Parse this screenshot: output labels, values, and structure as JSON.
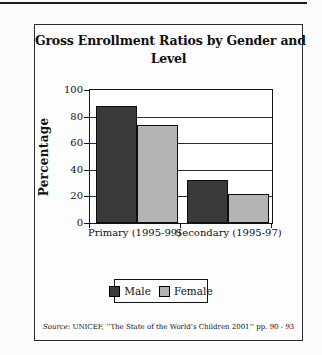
{
  "chart_data": {
    "type": "bar",
    "title": "Gross Enrollment Ratios by Gender and Level",
    "title_lines": [
      "Gross Enrollment Ratios by Gender and",
      "Level"
    ],
    "categories": [
      "Primary (1995-99)",
      "Secondary (1995-97)"
    ],
    "series": [
      {
        "name": "Male",
        "color": "#3a3a3a",
        "values": [
          88,
          32
        ]
      },
      {
        "name": "Female",
        "color": "#b4b4b4",
        "values": [
          74,
          22
        ]
      }
    ],
    "xlabel": "",
    "ylabel": "Percentage",
    "ylim": [
      0,
      100
    ],
    "yticks": [
      0,
      20,
      40,
      60,
      80,
      100
    ],
    "grid": true,
    "legend_position": "below-plot"
  },
  "source": {
    "prefix": "Source:",
    "text": " UNICEF, ‘‘The State of the World’s Children 2001’’ pp. 90 - 93"
  },
  "colors": {
    "male_bar": "#3a3a3a",
    "female_bar": "#b4b4b4",
    "frame": "#141414",
    "background": "#fdfdfd"
  }
}
